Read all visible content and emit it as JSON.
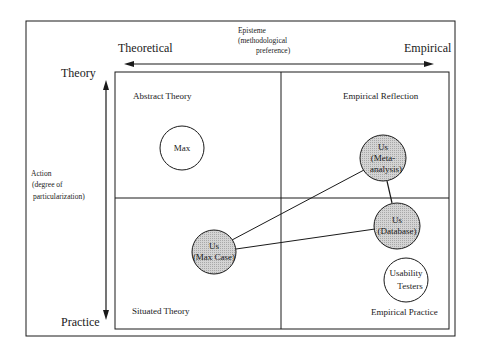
{
  "diagram": {
    "axes": {
      "horizontal": {
        "title": "Episteme",
        "subtitle_line1": "(methodological",
        "subtitle_line2": "preference)",
        "left_end": "Theoretical",
        "right_end": "Empirical"
      },
      "vertical": {
        "title": "Action",
        "subtitle_line1": "(degree of",
        "subtitle_line2": "particularization)",
        "top_end": "Theory",
        "bottom_end": "Practice"
      }
    },
    "quadrants": {
      "top_left": "Abstract Theory",
      "top_right": "Empirical Reflection",
      "bottom_left": "Situated Theory",
      "bottom_right": "Empirical Practice"
    },
    "nodes": [
      {
        "id": "max",
        "line1": "Max",
        "line2": "",
        "line3": "",
        "shaded": false
      },
      {
        "id": "us-meta",
        "line1": "Us",
        "line2": "(Meta-",
        "line3": "analysis)",
        "shaded": true
      },
      {
        "id": "us-database",
        "line1": "Us",
        "line2": "(Database)",
        "line3": "",
        "shaded": true
      },
      {
        "id": "us-maxcase",
        "line1": "Us",
        "line2": "(Max Case)",
        "line3": "",
        "shaded": true
      },
      {
        "id": "usability",
        "line1": "Usability",
        "line2": "Testers",
        "line3": "",
        "shaded": false
      }
    ],
    "edges": [
      [
        "us-maxcase",
        "us-meta"
      ],
      [
        "us-maxcase",
        "us-database"
      ],
      [
        "us-meta",
        "us-database"
      ]
    ],
    "colors": {
      "line": "#1a1a1a",
      "shaded_fill": "#c8c8c8",
      "background": "#ffffff"
    }
  }
}
